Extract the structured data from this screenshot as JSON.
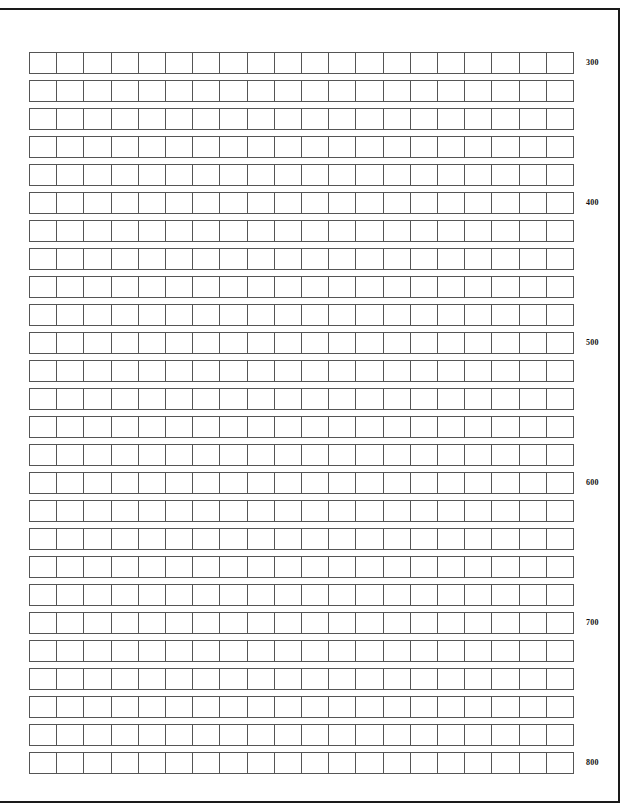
{
  "page": {
    "background_color": "#ffffff",
    "frame_color": "#1a1a1a",
    "grid_line_color": "#555555",
    "label_color": "#111111"
  },
  "grid": {
    "columns": 20,
    "rows": 26,
    "cells_per_row": 20,
    "total_cells": 520,
    "cell_content": ""
  },
  "row_labels": {
    "interval_rows": 5,
    "items": [
      {
        "row_index": 1,
        "value": "300"
      },
      {
        "row_index": 6,
        "value": "400"
      },
      {
        "row_index": 11,
        "value": "500"
      },
      {
        "row_index": 16,
        "value": "600"
      },
      {
        "row_index": 21,
        "value": "700"
      },
      {
        "row_index": 26,
        "value": "800"
      }
    ]
  }
}
